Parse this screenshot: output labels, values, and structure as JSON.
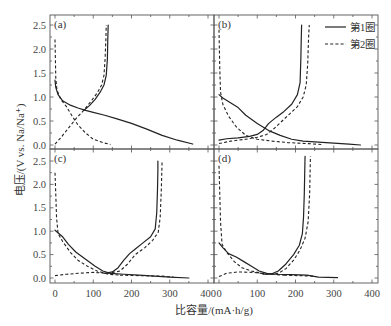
{
  "chart_data": {
    "type": "line",
    "layout": "2x2 panels, shared axes",
    "xlabel": "比容量/(mA·h/g)",
    "ylabel": "电压/(V vs. Na/Na⁺)",
    "xlim": [
      0,
      400
    ],
    "ylim": [
      0,
      2.5
    ],
    "x_ticks": [
      "0",
      "100",
      "200",
      "300",
      "400"
    ],
    "y_ticks": [
      "0.0",
      "0.5",
      "1.0",
      "1.5",
      "2.0",
      "2.5"
    ],
    "grid": false,
    "legend": {
      "position": "top-right of panel (b)",
      "entries": [
        {
          "name": "第1圈",
          "style": "solid"
        },
        {
          "name": "第2圈",
          "style": "dashed"
        }
      ]
    },
    "panels": [
      {
        "label": "(a)",
        "series": [
          {
            "name": "第1圈 discharge",
            "style": "solid",
            "points": [
              [
                0,
                1.35
              ],
              [
                2,
                1.2
              ],
              [
                8,
                1.05
              ],
              [
                20,
                0.92
              ],
              [
                40,
                0.83
              ],
              [
                60,
                0.77
              ],
              [
                80,
                0.72
              ],
              [
                100,
                0.68
              ],
              [
                130,
                0.62
              ],
              [
                160,
                0.55
              ],
              [
                200,
                0.45
              ],
              [
                240,
                0.33
              ],
              [
                280,
                0.2
              ],
              [
                320,
                0.1
              ],
              [
                360,
                0.02
              ]
            ]
          },
          {
            "name": "第1圈 charge",
            "style": "solid",
            "points": [
              [
                75,
                0.72
              ],
              [
                90,
                0.82
              ],
              [
                105,
                0.95
              ],
              [
                118,
                1.1
              ],
              [
                128,
                1.25
              ],
              [
                134,
                1.45
              ],
              [
                137,
                1.8
              ],
              [
                138,
                2.2
              ],
              [
                139,
                2.5
              ]
            ]
          },
          {
            "name": "第2圈 discharge",
            "style": "dashed",
            "points": [
              [
                0,
                2.2
              ],
              [
                1,
                1.8
              ],
              [
                2,
                1.4
              ],
              [
                5,
                1.15
              ],
              [
                15,
                0.95
              ],
              [
                30,
                0.8
              ],
              [
                45,
                0.6
              ],
              [
                60,
                0.42
              ],
              [
                80,
                0.25
              ],
              [
                100,
                0.12
              ],
              [
                125,
                0.05
              ],
              [
                145,
                0.01
              ]
            ]
          },
          {
            "name": "第2圈 charge",
            "style": "dashed",
            "points": [
              [
                0,
                0.02
              ],
              [
                15,
                0.15
              ],
              [
                35,
                0.35
              ],
              [
                55,
                0.55
              ],
              [
                75,
                0.72
              ],
              [
                95,
                0.92
              ],
              [
                110,
                1.08
              ],
              [
                122,
                1.25
              ],
              [
                128,
                1.45
              ],
              [
                131,
                1.8
              ],
              [
                133,
                2.2
              ],
              [
                134,
                2.5
              ]
            ]
          }
        ]
      },
      {
        "label": "(b)",
        "series": [
          {
            "name": "第1圈 discharge",
            "style": "solid",
            "points": [
              [
                0,
                1.05
              ],
              [
                10,
                0.98
              ],
              [
                30,
                0.88
              ],
              [
                50,
                0.78
              ],
              [
                70,
                0.62
              ],
              [
                100,
                0.45
              ],
              [
                130,
                0.3
              ],
              [
                160,
                0.2
              ],
              [
                190,
                0.12
              ],
              [
                220,
                0.08
              ],
              [
                260,
                0.06
              ],
              [
                300,
                0.04
              ],
              [
                340,
                0.02
              ],
              [
                370,
                0.0
              ]
            ]
          },
          {
            "name": "第1圈 charge",
            "style": "solid",
            "points": [
              [
                0,
                0.1
              ],
              [
                20,
                0.13
              ],
              [
                50,
                0.15
              ],
              [
                80,
                0.18
              ],
              [
                100,
                0.22
              ],
              [
                115,
                0.3
              ],
              [
                130,
                0.45
              ],
              [
                150,
                0.58
              ],
              [
                170,
                0.7
              ],
              [
                190,
                0.85
              ],
              [
                205,
                1.05
              ],
              [
                212,
                1.3
              ],
              [
                214,
                1.8
              ],
              [
                215,
                2.2
              ],
              [
                216,
                2.5
              ]
            ]
          },
          {
            "name": "第2圈 discharge",
            "style": "dashed",
            "points": [
              [
                0,
                2.4
              ],
              [
                1,
                2.0
              ],
              [
                2,
                1.6
              ],
              [
                4,
                1.1
              ],
              [
                10,
                0.85
              ],
              [
                25,
                0.6
              ],
              [
                45,
                0.38
              ],
              [
                70,
                0.2
              ],
              [
                100,
                0.12
              ],
              [
                140,
                0.08
              ],
              [
                180,
                0.05
              ],
              [
                230,
                0.03
              ],
              [
                270,
                0.01
              ]
            ]
          },
          {
            "name": "第2圈 charge",
            "style": "dashed",
            "points": [
              [
                0,
                0.03
              ],
              [
                30,
                0.08
              ],
              [
                70,
                0.12
              ],
              [
                100,
                0.16
              ],
              [
                125,
                0.22
              ],
              [
                145,
                0.35
              ],
              [
                165,
                0.5
              ],
              [
                185,
                0.65
              ],
              [
                205,
                0.8
              ],
              [
                220,
                1.0
              ],
              [
                228,
                1.25
              ],
              [
                232,
                1.7
              ],
              [
                234,
                2.2
              ],
              [
                236,
                2.5
              ]
            ]
          }
        ]
      },
      {
        "label": "(c)",
        "series": [
          {
            "name": "第1圈 discharge",
            "style": "solid",
            "points": [
              [
                0,
                1.02
              ],
              [
                10,
                0.95
              ],
              [
                20,
                0.88
              ],
              [
                35,
                0.72
              ],
              [
                55,
                0.55
              ],
              [
                80,
                0.4
              ],
              [
                105,
                0.25
              ],
              [
                125,
                0.15
              ],
              [
                145,
                0.1
              ],
              [
                180,
                0.08
              ],
              [
                220,
                0.06
              ],
              [
                260,
                0.04
              ],
              [
                300,
                0.02
              ],
              [
                350,
                0.0
              ]
            ]
          },
          {
            "name": "第1圈 charge",
            "style": "solid",
            "points": [
              [
                130,
                0.1
              ],
              [
                150,
                0.13
              ],
              [
                165,
                0.22
              ],
              [
                180,
                0.38
              ],
              [
                195,
                0.52
              ],
              [
                210,
                0.62
              ],
              [
                230,
                0.75
              ],
              [
                250,
                0.88
              ],
              [
                262,
                1.05
              ],
              [
                266,
                1.4
              ],
              [
                268,
                1.9
              ],
              [
                269,
                2.3
              ],
              [
                269,
                2.5
              ]
            ]
          },
          {
            "name": "第2圈 discharge",
            "style": "dashed",
            "points": [
              [
                0,
                2.25
              ],
              [
                2,
                1.8
              ],
              [
                4,
                1.3
              ],
              [
                8,
                0.95
              ],
              [
                20,
                0.78
              ],
              [
                40,
                0.55
              ],
              [
                60,
                0.38
              ],
              [
                85,
                0.25
              ],
              [
                110,
                0.15
              ],
              [
                140,
                0.08
              ],
              [
                170,
                0.06
              ]
            ]
          },
          {
            "name": "第2圈 charge",
            "style": "dashed",
            "points": [
              [
                0,
                0.05
              ],
              [
                30,
                0.08
              ],
              [
                60,
                0.1
              ],
              [
                100,
                0.12
              ],
              [
                140,
                0.1
              ],
              [
                170,
                0.15
              ],
              [
                190,
                0.3
              ],
              [
                210,
                0.5
              ],
              [
                235,
                0.65
              ],
              [
                255,
                0.8
              ],
              [
                270,
                0.98
              ],
              [
                275,
                1.3
              ],
              [
                278,
                1.9
              ],
              [
                280,
                2.5
              ]
            ]
          },
          {
            "name": "第2圈 tail",
            "style": "dashed",
            "points": [
              [
                170,
                0.06
              ],
              [
                220,
                0.05
              ],
              [
                280,
                0.04
              ],
              [
                310,
                0.02
              ]
            ]
          }
        ]
      },
      {
        "label": "(d)",
        "series": [
          {
            "name": "第1圈 discharge",
            "style": "solid",
            "points": [
              [
                0,
                0.75
              ],
              [
                10,
                0.65
              ],
              [
                25,
                0.52
              ],
              [
                45,
                0.45
              ],
              [
                65,
                0.35
              ],
              [
                85,
                0.25
              ],
              [
                105,
                0.15
              ],
              [
                125,
                0.1
              ],
              [
                150,
                0.08
              ],
              [
                190,
                0.07
              ],
              [
                230,
                0.06
              ],
              [
                260,
                0.02
              ],
              [
                310,
                0.01
              ]
            ]
          },
          {
            "name": "第1圈 charge",
            "style": "solid",
            "points": [
              [
                115,
                0.08
              ],
              [
                135,
                0.08
              ],
              [
                155,
                0.15
              ],
              [
                175,
                0.3
              ],
              [
                195,
                0.5
              ],
              [
                210,
                0.7
              ],
              [
                218,
                0.95
              ],
              [
                221,
                1.3
              ],
              [
                223,
                1.8
              ],
              [
                224,
                2.2
              ],
              [
                225,
                2.6
              ]
            ]
          },
          {
            "name": "第2圈 discharge",
            "style": "dashed",
            "points": [
              [
                0,
                2.4
              ],
              [
                2,
                1.8
              ],
              [
                4,
                1.2
              ],
              [
                8,
                0.72
              ],
              [
                20,
                0.55
              ],
              [
                40,
                0.35
              ],
              [
                60,
                0.22
              ],
              [
                85,
                0.15
              ],
              [
                110,
                0.1
              ],
              [
                140,
                0.08
              ],
              [
                170,
                0.06
              ]
            ]
          },
          {
            "name": "第2圈 charge",
            "style": "dashed",
            "points": [
              [
                0,
                0.03
              ],
              [
                20,
                0.1
              ],
              [
                50,
                0.13
              ],
              [
                90,
                0.12
              ],
              [
                130,
                0.08
              ],
              [
                155,
                0.1
              ],
              [
                175,
                0.2
              ],
              [
                195,
                0.38
              ],
              [
                212,
                0.6
              ],
              [
                225,
                0.85
              ],
              [
                233,
                1.2
              ],
              [
                237,
                1.8
              ],
              [
                239,
                2.6
              ]
            ]
          },
          {
            "name": "第2圈 tail",
            "style": "dashed",
            "points": [
              [
                170,
                0.06
              ],
              [
                210,
                0.05
              ],
              [
                250,
                0.04
              ]
            ]
          }
        ]
      }
    ]
  }
}
